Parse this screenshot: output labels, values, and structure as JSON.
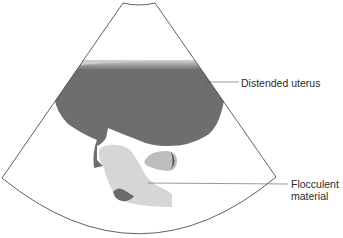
{
  "diagram": {
    "type": "ultrasound-schematic",
    "view": "sector scan",
    "colors": {
      "background": "#ffffff",
      "outline": "#3a3a3a",
      "uterus_fill": "#6e6e6e",
      "flocculent_fill": "#d6d6d6",
      "oval_fill": "#bdbdbd",
      "dark_blob": "#6a6a6a",
      "leader_line": "#555555",
      "label_text": "#2b2b2b"
    }
  },
  "labels": {
    "distended_uterus": "Distended uterus",
    "flocculent_line1": "Flocculent",
    "flocculent_line2": "material"
  }
}
